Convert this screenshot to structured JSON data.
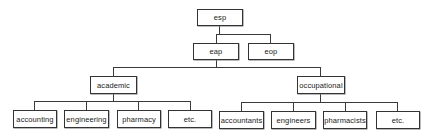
{
  "diagram": {
    "type": "tree",
    "root": {
      "label": "esp",
      "children": [
        {
          "label": "eap",
          "children": [
            {
              "label": "academic",
              "children": [
                {
                  "label": "accounting"
                },
                {
                  "label": "engineering"
                },
                {
                  "label": "pharmacy"
                },
                {
                  "label": "etc."
                }
              ]
            },
            {
              "label": "occupational",
              "children": [
                {
                  "label": "accountants"
                },
                {
                  "label": "engineers"
                },
                {
                  "label": "pharmacists"
                },
                {
                  "label": "etc."
                }
              ]
            }
          ]
        },
        {
          "label": "eop"
        }
      ]
    }
  },
  "nodes": {
    "esp": "esp",
    "eap": "eap",
    "eop": "eop",
    "academic": "academic",
    "occupational": "occupational",
    "academic_children": [
      "accounting",
      "engineering",
      "pharmacy",
      "etc."
    ],
    "occupational_children": [
      "accountants",
      "engineers",
      "pharmacists",
      "etc."
    ]
  },
  "colors": {
    "stroke": "#333333",
    "background": "#ffffff",
    "text": "#222222"
  }
}
